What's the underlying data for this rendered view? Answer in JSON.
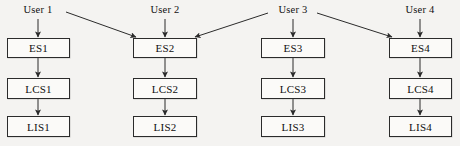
{
  "diagram": {
    "type": "block-flow-diagram",
    "canvas": {
      "width": 460,
      "height": 146
    },
    "colors": {
      "background": "#f4f3f1",
      "box_fill": "#fbfaf8",
      "stroke": "#2b2b2b",
      "text": "#101010"
    },
    "users": [
      {
        "id": "user1",
        "label": "User 1",
        "x": 38,
        "y": 11
      },
      {
        "id": "user2",
        "label": "User 2",
        "x": 165,
        "y": 11
      },
      {
        "id": "user3",
        "label": "User 3",
        "x": 293,
        "y": 11
      },
      {
        "id": "user4",
        "label": "User 4",
        "x": 420,
        "y": 11
      }
    ],
    "columns": [
      {
        "id": "col1",
        "left": 7,
        "width": 63
      },
      {
        "id": "col2",
        "left": 133,
        "width": 64
      },
      {
        "id": "col3",
        "left": 261,
        "width": 64
      },
      {
        "id": "col4",
        "left": 389,
        "width": 63
      }
    ],
    "rows": [
      {
        "id": "es",
        "top": 38,
        "height": 20
      },
      {
        "id": "lcs",
        "top": 78,
        "height": 21
      },
      {
        "id": "lis",
        "top": 116,
        "height": 21
      }
    ],
    "nodes": [
      {
        "id": "es1",
        "label": "ES1",
        "col": 0,
        "row": 0
      },
      {
        "id": "es2",
        "label": "ES2",
        "col": 1,
        "row": 0
      },
      {
        "id": "es3",
        "label": "ES3",
        "col": 2,
        "row": 0
      },
      {
        "id": "es4",
        "label": "ES4",
        "col": 3,
        "row": 0
      },
      {
        "id": "lcs1",
        "label": "LCS1",
        "col": 0,
        "row": 1
      },
      {
        "id": "lcs2",
        "label": "LCS2",
        "col": 1,
        "row": 1
      },
      {
        "id": "lcs3",
        "label": "LCS3",
        "col": 2,
        "row": 1
      },
      {
        "id": "lcs4",
        "label": "LCS4",
        "col": 3,
        "row": 1
      },
      {
        "id": "lis1",
        "label": "LIS1",
        "col": 0,
        "row": 2
      },
      {
        "id": "lis2",
        "label": "LIS2",
        "col": 1,
        "row": 2
      },
      {
        "id": "lis3",
        "label": "LIS3",
        "col": 2,
        "row": 2
      },
      {
        "id": "lis4",
        "label": "LIS4",
        "col": 3,
        "row": 2
      }
    ],
    "edges": [
      {
        "id": "user1-es1",
        "from": "user1",
        "to": "es1",
        "kind": "vertical",
        "x1": 38,
        "y1": 19,
        "x2": 38,
        "y2": 37
      },
      {
        "id": "user2-es2",
        "from": "user2",
        "to": "es2",
        "kind": "vertical",
        "x1": 165,
        "y1": 19,
        "x2": 165,
        "y2": 37
      },
      {
        "id": "user3-es3",
        "from": "user3",
        "to": "es3",
        "kind": "vertical",
        "x1": 293,
        "y1": 19,
        "x2": 293,
        "y2": 37
      },
      {
        "id": "user4-es4",
        "from": "user4",
        "to": "es4",
        "kind": "vertical",
        "x1": 420,
        "y1": 19,
        "x2": 420,
        "y2": 37
      },
      {
        "id": "user1-es2",
        "from": "user1",
        "to": "es2",
        "kind": "diagonal",
        "x1": 66,
        "y1": 12,
        "x2": 136,
        "y2": 37
      },
      {
        "id": "user3-es2",
        "from": "user3",
        "to": "es2",
        "kind": "diagonal",
        "x1": 268,
        "y1": 13,
        "x2": 195,
        "y2": 37
      },
      {
        "id": "user3-es4",
        "from": "user3",
        "to": "es4",
        "kind": "diagonal",
        "x1": 317,
        "y1": 13,
        "x2": 392,
        "y2": 37
      },
      {
        "id": "es1-lcs1",
        "from": "es1",
        "to": "lcs1",
        "kind": "vertical",
        "x1": 38,
        "y1": 58,
        "x2": 38,
        "y2": 77
      },
      {
        "id": "es2-lcs2",
        "from": "es2",
        "to": "lcs2",
        "kind": "vertical",
        "x1": 165,
        "y1": 58,
        "x2": 165,
        "y2": 77
      },
      {
        "id": "es3-lcs3",
        "from": "es3",
        "to": "lcs3",
        "kind": "vertical",
        "x1": 293,
        "y1": 58,
        "x2": 293,
        "y2": 77
      },
      {
        "id": "es4-lcs4",
        "from": "es4",
        "to": "lcs4",
        "kind": "vertical",
        "x1": 420,
        "y1": 58,
        "x2": 420,
        "y2": 77
      },
      {
        "id": "lcs1-lis1",
        "from": "lcs1",
        "to": "lis1",
        "kind": "vertical",
        "x1": 38,
        "y1": 99,
        "x2": 38,
        "y2": 115
      },
      {
        "id": "lcs2-lis2",
        "from": "lcs2",
        "to": "lis2",
        "kind": "vertical",
        "x1": 165,
        "y1": 99,
        "x2": 165,
        "y2": 115
      },
      {
        "id": "lcs3-lis3",
        "from": "lcs3",
        "to": "lis3",
        "kind": "vertical",
        "x1": 293,
        "y1": 99,
        "x2": 293,
        "y2": 115
      },
      {
        "id": "lcs4-lis4",
        "from": "lcs4",
        "to": "lis4",
        "kind": "vertical",
        "x1": 420,
        "y1": 99,
        "x2": 420,
        "y2": 115
      }
    ]
  }
}
